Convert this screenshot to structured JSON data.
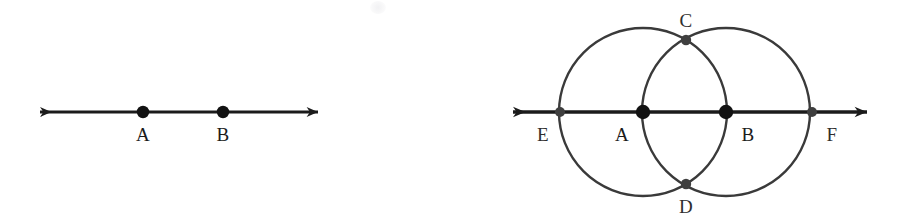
{
  "canvas": {
    "width": 908,
    "height": 220,
    "background": "#ffffff"
  },
  "style": {
    "stroke_dark": "#1b1b1b",
    "stroke_circle": "#3a3a3a",
    "dot_dark": "#121212",
    "dot_soft": "#4a4a4a",
    "label_color": "#1b1b1b"
  },
  "figures": [
    {
      "id": "figure-left",
      "name": "line-with-two-points",
      "line": {
        "y": 112,
        "x_start": 28,
        "x_end": 330,
        "stroke_width": 3.2,
        "arrow_left": true,
        "arrow_right": true
      },
      "points": [
        {
          "id": "A",
          "label": "A",
          "x": 143,
          "y": 112,
          "r": 6.2,
          "fill": "#121212",
          "label_x": 143,
          "label_y": 134
        },
        {
          "id": "B",
          "label": "B",
          "x": 223,
          "y": 112,
          "r": 6.2,
          "fill": "#121212",
          "label_x": 223,
          "label_y": 134
        }
      ]
    },
    {
      "id": "figure-right",
      "name": "two-intersecting-circles-construction",
      "line": {
        "y": 112,
        "x_start": 500,
        "x_end": 880,
        "stroke_width": 3.4,
        "arrow_left": true,
        "arrow_right": true
      },
      "circles": [
        {
          "id": "circle-A",
          "center_x": 643,
          "center_y": 112,
          "radius": 84,
          "stroke": "#3a3a3a",
          "stroke_width": 2.4
        },
        {
          "id": "circle-B",
          "center_x": 726,
          "center_y": 112,
          "radius": 84,
          "stroke": "#3a3a3a",
          "stroke_width": 2.4
        }
      ],
      "points": [
        {
          "id": "E",
          "label": "E",
          "x": 560,
          "y": 112,
          "r": 5.0,
          "fill": "#3f3f3f",
          "label_x": 543,
          "label_y": 134
        },
        {
          "id": "A",
          "label": "A",
          "x": 643,
          "y": 112,
          "r": 7.2,
          "fill": "#121212",
          "label_x": 622,
          "label_y": 134
        },
        {
          "id": "B",
          "label": "B",
          "x": 726,
          "y": 112,
          "r": 7.2,
          "fill": "#121212",
          "label_x": 748,
          "label_y": 134
        },
        {
          "id": "F",
          "label": "F",
          "x": 812,
          "y": 112,
          "r": 5.0,
          "fill": "#3f3f3f",
          "label_x": 832,
          "label_y": 134
        },
        {
          "id": "C",
          "label": "C",
          "x": 686,
          "y": 40,
          "r": 5.2,
          "fill": "#3f3f3f",
          "label_x": 686,
          "label_y": 20
        },
        {
          "id": "D",
          "label": "D",
          "x": 686,
          "y": 184,
          "r": 5.2,
          "fill": "#3f3f3f",
          "label_x": 686,
          "label_y": 206
        }
      ]
    }
  ]
}
